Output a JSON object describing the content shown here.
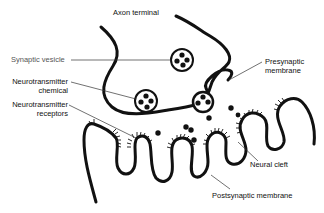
{
  "diagram": {
    "labels": {
      "axon_terminal": "Axon terminal",
      "synaptic_vesicle": "Synaptic vesicle",
      "neurotransmitter_chemical_1": "Neurotransmitter",
      "neurotransmitter_chemical_2": "chemical",
      "neurotransmitter_receptors_1": "Neurotransmitter",
      "neurotransmitter_receptors_2": "receptors",
      "presynaptic_membrane_1": "Presynaptic",
      "presynaptic_membrane_2": "membrane",
      "neural_cleft": "Neural cleft",
      "postsynaptic_membrane": "Postsynaptic membrane"
    },
    "colors": {
      "stroke": "#111111",
      "background": "#ffffff",
      "label_gray": "#555555"
    }
  }
}
